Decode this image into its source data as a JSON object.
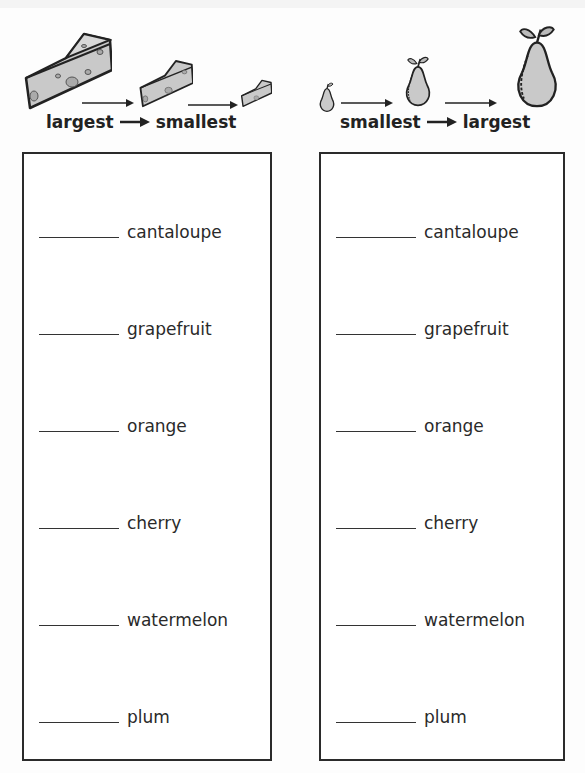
{
  "worksheet": {
    "left_section": {
      "instruction": {
        "from": "largest",
        "to": "smallest"
      },
      "picture": "cheese-wedges-decreasing",
      "items": [
        {
          "blank": "",
          "label": "cantaloupe"
        },
        {
          "blank": "",
          "label": "grapefruit"
        },
        {
          "blank": "",
          "label": "orange"
        },
        {
          "blank": "",
          "label": "cherry"
        },
        {
          "blank": "",
          "label": "watermelon"
        },
        {
          "blank": "",
          "label": "plum"
        }
      ]
    },
    "right_section": {
      "instruction": {
        "from": "smallest",
        "to": "largest"
      },
      "picture": "pears-increasing",
      "items": [
        {
          "blank": "",
          "label": "cantaloupe"
        },
        {
          "blank": "",
          "label": "grapefruit"
        },
        {
          "blank": "",
          "label": "orange"
        },
        {
          "blank": "",
          "label": "cherry"
        },
        {
          "blank": "",
          "label": "watermelon"
        },
        {
          "blank": "",
          "label": "plum"
        }
      ]
    },
    "colors": {
      "ink": "#222222",
      "fill_gray": "#c8c8c8",
      "border": "#2b2b2b"
    }
  }
}
